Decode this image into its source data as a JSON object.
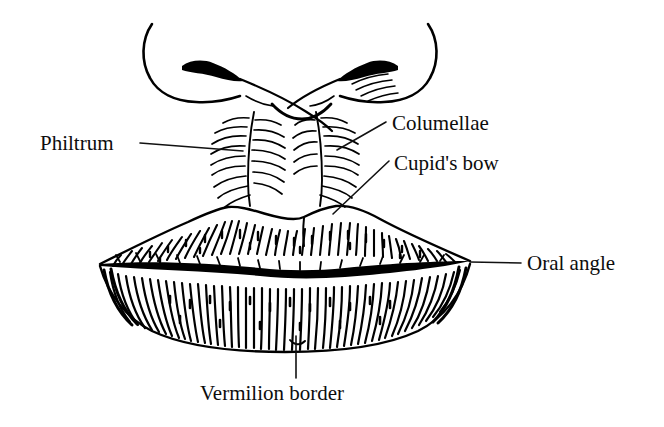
{
  "figure": {
    "background_color": "#ffffff",
    "ink_color": "#000000",
    "labels": [
      {
        "id": "philtrum",
        "text": "Philtrum",
        "text_x": 40,
        "text_baseline_y": 150,
        "anchor": "start",
        "leader": {
          "x1": 140,
          "y1": 143,
          "x2": 243,
          "y2": 151
        },
        "points_to": "median groove of the upper lip"
      },
      {
        "id": "columellae",
        "text": "Columellae",
        "text_x": 392,
        "text_baseline_y": 130,
        "anchor": "start",
        "leader": {
          "x1": 386,
          "y1": 122,
          "x2": 337,
          "y2": 150
        },
        "points_to": "paired vertical philtral ridges"
      },
      {
        "id": "cupids-bow",
        "text": "Cupid's bow",
        "text_x": 394,
        "text_baseline_y": 170,
        "anchor": "start",
        "leader": {
          "x1": 389,
          "y1": 161,
          "x2": 333,
          "y2": 214
        },
        "points_to": "double curve of the upper vermilion border"
      },
      {
        "id": "oral-angle",
        "text": "Oral angle",
        "text_x": 527,
        "text_baseline_y": 270,
        "anchor": "start",
        "leader": {
          "x1": 521,
          "y1": 263,
          "x2": 470,
          "y2": 262
        },
        "points_to": "lateral commissure of the mouth"
      },
      {
        "id": "vermilion-border",
        "text": "Vermilion border",
        "text_x": 200,
        "text_baseline_y": 400,
        "anchor": "start",
        "leader": {
          "x1": 296,
          "y1": 378,
          "x2": 296,
          "y2": 336
        },
        "points_to": "margin of the lower lip vermilion"
      }
    ]
  }
}
